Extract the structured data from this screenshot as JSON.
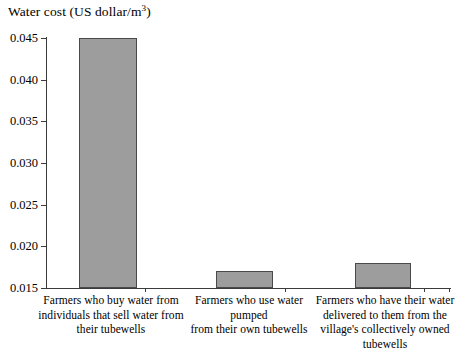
{
  "chart_data": {
    "type": "bar",
    "title": "Water cost (US dollar/m3)",
    "title_prefix": "Water cost (US dollar/m",
    "title_superscript": "3",
    "title_suffix": ")",
    "xlabel": "",
    "ylabel": "Water cost (US dollar/m3)",
    "ylim": [
      0.015,
      0.045
    ],
    "ytick_labels": [
      "0.045",
      "0.040",
      "0.035",
      "0.030",
      "0.025",
      "0.020",
      "0.015"
    ],
    "ytick_values": [
      0.045,
      0.04,
      0.035,
      0.03,
      0.025,
      0.02,
      0.015
    ],
    "grid": false,
    "legend": false,
    "bar_fill_color": "#9d9d9d",
    "bar_border_color": "#4a4a4a",
    "axis_color": "#3b3b3b",
    "categories": [
      "Farmers who buy water from individuals that sell water from their tubewells",
      "Farmers who use water pumped from their own tubewells",
      "Farmers who have their water delivered to them from the village's collectively owned tubewells"
    ],
    "category_lines": [
      [
        "Farmers who buy water from",
        "individuals that sell water from",
        "their tubewells"
      ],
      [
        "Farmers who use water pumped",
        "from their own tubewells"
      ],
      [
        "Farmers who have their water",
        "delivered to them from the",
        "village's collectively owned",
        "tubewells"
      ]
    ],
    "values": [
      0.045,
      0.017,
      0.018
    ]
  }
}
